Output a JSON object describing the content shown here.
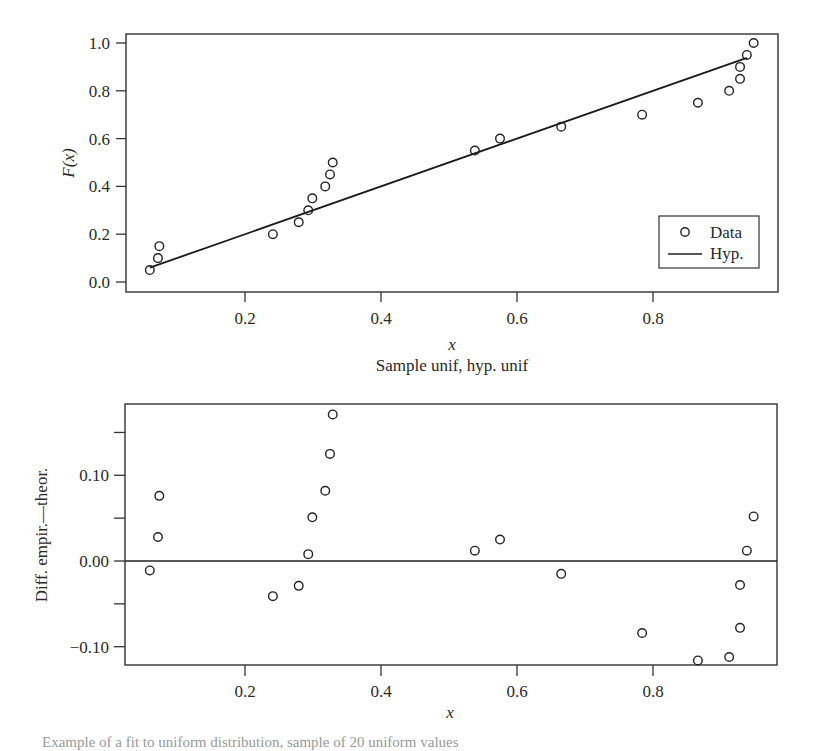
{
  "chart_data": [
    {
      "type": "scatter",
      "title": "",
      "xlabel": "x",
      "ylabel": "F(x)",
      "subtitle": "Sample unif, hyp. unif",
      "xlim": [
        0.03,
        0.98
      ],
      "ylim": [
        -0.03,
        1.03
      ],
      "xticks": [
        0.2,
        0.4,
        0.6,
        0.8
      ],
      "yticks": [
        0.0,
        0.2,
        0.4,
        0.6,
        0.8,
        1.0
      ],
      "xtick_labels": [
        "0.2",
        "0.4",
        "0.6",
        "0.8"
      ],
      "ytick_labels": [
        "0.0",
        "0.2",
        "0.4",
        "0.6",
        "0.8",
        "1.0"
      ],
      "grid": false,
      "legend": {
        "position": "lower right",
        "entries": [
          "Data",
          "Hyp."
        ]
      },
      "series": [
        {
          "name": "Data",
          "marker": "open-circle",
          "x": [
            0.06,
            0.072,
            0.074,
            0.241,
            0.279,
            0.293,
            0.299,
            0.318,
            0.325,
            0.329,
            0.538,
            0.575,
            0.665,
            0.784,
            0.866,
            0.912,
            0.928,
            0.928,
            0.938,
            0.948
          ],
          "y": [
            0.05,
            0.1,
            0.15,
            0.2,
            0.25,
            0.3,
            0.35,
            0.4,
            0.45,
            0.5,
            0.55,
            0.6,
            0.65,
            0.7,
            0.75,
            0.8,
            0.85,
            0.9,
            0.95,
            1.0
          ]
        },
        {
          "name": "Hyp.",
          "style": "line",
          "x": [
            0.06,
            0.938
          ],
          "y": [
            0.06,
            0.938
          ]
        }
      ]
    },
    {
      "type": "scatter",
      "title": "",
      "xlabel": "x",
      "ylabel": "Diff. empir.—theor.",
      "xlim": [
        0.03,
        0.98
      ],
      "ylim": [
        -0.125,
        0.18
      ],
      "xticks": [
        0.2,
        0.4,
        0.6,
        0.8
      ],
      "yticks": [
        -0.1,
        -0.05,
        0.0,
        0.05,
        0.1,
        0.15
      ],
      "xtick_labels": [
        "0.2",
        "0.4",
        "0.6",
        "0.8"
      ],
      "ytick_labels": [
        "−0.10",
        "",
        "0.00",
        "",
        "0.10",
        ""
      ],
      "grid": false,
      "reference_line": 0.0,
      "series": [
        {
          "name": "Difference",
          "marker": "open-circle",
          "x": [
            0.06,
            0.072,
            0.074,
            0.241,
            0.279,
            0.293,
            0.299,
            0.318,
            0.325,
            0.329,
            0.538,
            0.575,
            0.665,
            0.784,
            0.866,
            0.912,
            0.928,
            0.928,
            0.938,
            0.948
          ],
          "y": [
            -0.011,
            0.028,
            0.076,
            -0.041,
            -0.029,
            0.008,
            0.051,
            0.082,
            0.125,
            0.171,
            0.012,
            0.025,
            -0.015,
            -0.084,
            -0.116,
            -0.112,
            -0.078,
            -0.028,
            0.012,
            0.052
          ]
        }
      ]
    }
  ],
  "top_plot": {
    "ylabel": "F(x)",
    "xlabel": "x",
    "subtitle": "Sample unif, hyp. unif",
    "legend": {
      "data_label": "Data",
      "hyp_label": "Hyp."
    }
  },
  "bottom_plot": {
    "ylabel": "Diff. empir.—theor.",
    "xlabel": "x"
  },
  "caption": "Example of a fit to uniform distribution, sample of 20 uniform values"
}
